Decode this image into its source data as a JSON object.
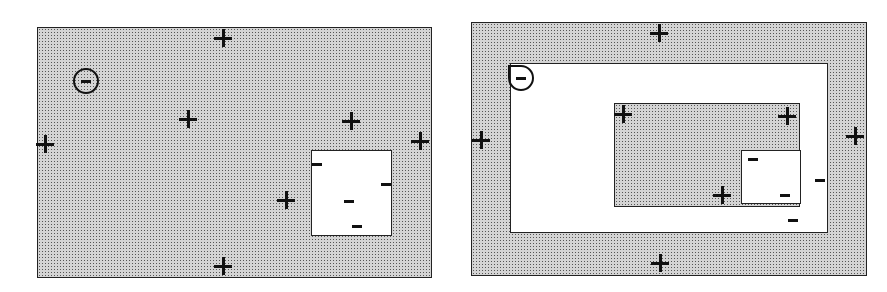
{
  "diagram": {
    "left_panel": {
      "plus_count": 8,
      "minus_count": 5,
      "circled_minus": 1
    },
    "right_panel": {
      "plus_count": 7,
      "minus_count": 5,
      "circled_minus": 1
    },
    "colors": {
      "stipple": "#d4d4d4",
      "ink": "#111111",
      "background": "#ffffff"
    }
  }
}
